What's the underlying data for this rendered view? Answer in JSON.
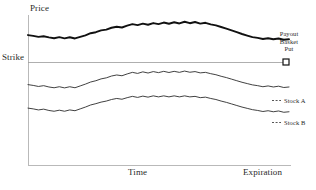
{
  "chart_data": {
    "type": "line",
    "title": "",
    "xlabel": "Time",
    "ylabel": "Price",
    "grid": false,
    "legend_position": "right",
    "annotations": {
      "y_axis_caption": "Price",
      "strike_caption": "Strike",
      "x_axis_caption": "Time",
      "x_axis_end_caption": "Expiration"
    },
    "reference_lines": [
      {
        "name": "strike",
        "label": "Strike",
        "orientation": "horizontal",
        "value": 100
      }
    ],
    "xlim": [
      0,
      100
    ],
    "ylim": [
      0,
      100
    ],
    "series": [
      {
        "name": "Payout Basket Put",
        "label_lines": [
          "Payout",
          "Basket",
          "Put"
        ],
        "style": "thick",
        "color": "#111111",
        "marker": "square",
        "x": [
          0,
          2,
          4,
          6,
          8,
          10,
          12,
          14,
          16,
          18,
          20,
          22,
          24,
          26,
          28,
          30,
          32,
          34,
          36,
          38,
          40,
          42,
          44,
          46,
          48,
          50,
          52,
          54,
          56,
          58,
          60,
          62,
          64,
          66,
          68,
          70,
          72,
          74,
          76,
          78,
          80,
          82,
          84,
          86,
          88,
          90,
          92,
          94,
          96,
          98,
          100
        ],
        "y": [
          100,
          99.4,
          98.6,
          99.1,
          98.2,
          97.6,
          98.4,
          97.5,
          98.3,
          97.4,
          98.6,
          99.8,
          101.4,
          102.2,
          103.6,
          104.2,
          105.6,
          106.4,
          105.8,
          107.2,
          108.4,
          107.6,
          108.8,
          107.9,
          109.2,
          108.4,
          109.6,
          108.7,
          109.8,
          108.9,
          110.2,
          109.1,
          110.0,
          108.8,
          109.4,
          108.2,
          107.4,
          106.2,
          105.0,
          103.6,
          102.2,
          100.8,
          99.6,
          98.4,
          97.8,
          97.0,
          97.6,
          96.8,
          97.4,
          96.4,
          96.8
        ]
      },
      {
        "name": "Stock A",
        "label_lines": [
          "Stock A"
        ],
        "style": "thin",
        "color": "#2b2b2b",
        "marker": "none",
        "x": [
          0,
          2,
          4,
          6,
          8,
          10,
          12,
          14,
          16,
          18,
          20,
          22,
          24,
          26,
          28,
          30,
          32,
          34,
          36,
          38,
          40,
          42,
          44,
          46,
          48,
          50,
          52,
          54,
          56,
          58,
          60,
          62,
          64,
          66,
          68,
          70,
          72,
          74,
          76,
          78,
          80,
          82,
          84,
          86,
          88,
          90,
          92,
          94,
          96,
          98,
          100
        ],
        "y": [
          62,
          61.4,
          60.6,
          61.2,
          60.2,
          59.6,
          60.4,
          59.5,
          60.4,
          59.6,
          61.0,
          62.4,
          64.0,
          65.0,
          66.4,
          67.2,
          68.6,
          69.4,
          68.8,
          70.2,
          71.4,
          70.6,
          71.8,
          70.9,
          72.0,
          71.2,
          72.2,
          71.3,
          72.2,
          71.4,
          72.4,
          71.5,
          72.0,
          71.0,
          71.4,
          70.4,
          69.6,
          68.4,
          67.4,
          66.2,
          65.0,
          63.8,
          62.8,
          61.8,
          61.2,
          60.4,
          61.0,
          60.2,
          60.8,
          59.8,
          60.2
        ]
      },
      {
        "name": "Stock B",
        "label_lines": [
          "Stock B"
        ],
        "style": "thin",
        "color": "#2b2b2b",
        "marker": "none",
        "x": [
          0,
          2,
          4,
          6,
          8,
          10,
          12,
          14,
          16,
          18,
          20,
          22,
          24,
          26,
          28,
          30,
          32,
          34,
          36,
          38,
          40,
          42,
          44,
          46,
          48,
          50,
          52,
          54,
          56,
          58,
          60,
          62,
          64,
          66,
          68,
          70,
          72,
          74,
          76,
          78,
          80,
          82,
          84,
          86,
          88,
          90,
          92,
          94,
          96,
          98,
          100
        ],
        "y": [
          44,
          43.4,
          42.6,
          43.2,
          42.2,
          41.6,
          42.4,
          41.6,
          42.6,
          42.0,
          43.4,
          44.8,
          46.4,
          47.4,
          48.6,
          49.4,
          50.6,
          51.4,
          50.8,
          52.0,
          53.0,
          52.2,
          53.2,
          52.4,
          53.4,
          52.6,
          53.4,
          52.6,
          53.4,
          52.6,
          53.4,
          52.6,
          53.0,
          52.0,
          52.4,
          51.4,
          50.6,
          49.4,
          48.4,
          47.2,
          46.0,
          44.8,
          43.8,
          42.8,
          42.2,
          41.4,
          42.0,
          41.2,
          41.8,
          40.8,
          41.2
        ]
      }
    ]
  },
  "colors": {
    "axis": "#b9b9b9",
    "strike_line": "#9a9a9a",
    "payout_curve": "#111111",
    "stock_curve": "#2b2b2b",
    "text": "#2a2a2a"
  }
}
